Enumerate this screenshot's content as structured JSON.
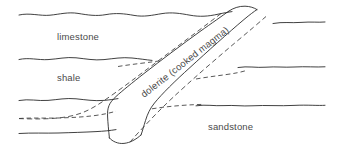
{
  "figure": {
    "type": "geological-cross-section",
    "background_color": "#ffffff",
    "line_color": "#2b2b2b",
    "dashed_line_color": "#3a3a3a",
    "label_color": "#4a4a4a"
  },
  "labels": {
    "limestone": "limestone",
    "shale": "shale",
    "sandstone": "sandstone",
    "dolerite": "dolerite (cooked magma)"
  },
  "strata": [
    {
      "name": "limestone",
      "label": "limestone"
    },
    {
      "name": "shale",
      "label": "shale"
    },
    {
      "name": "sandstone",
      "label": "sandstone"
    }
  ],
  "intrusion": {
    "name": "dolerite",
    "label": "dolerite (cooked magma)",
    "description_text": "dolerite (cooked magma)",
    "label_rotation_degrees": -38
  }
}
